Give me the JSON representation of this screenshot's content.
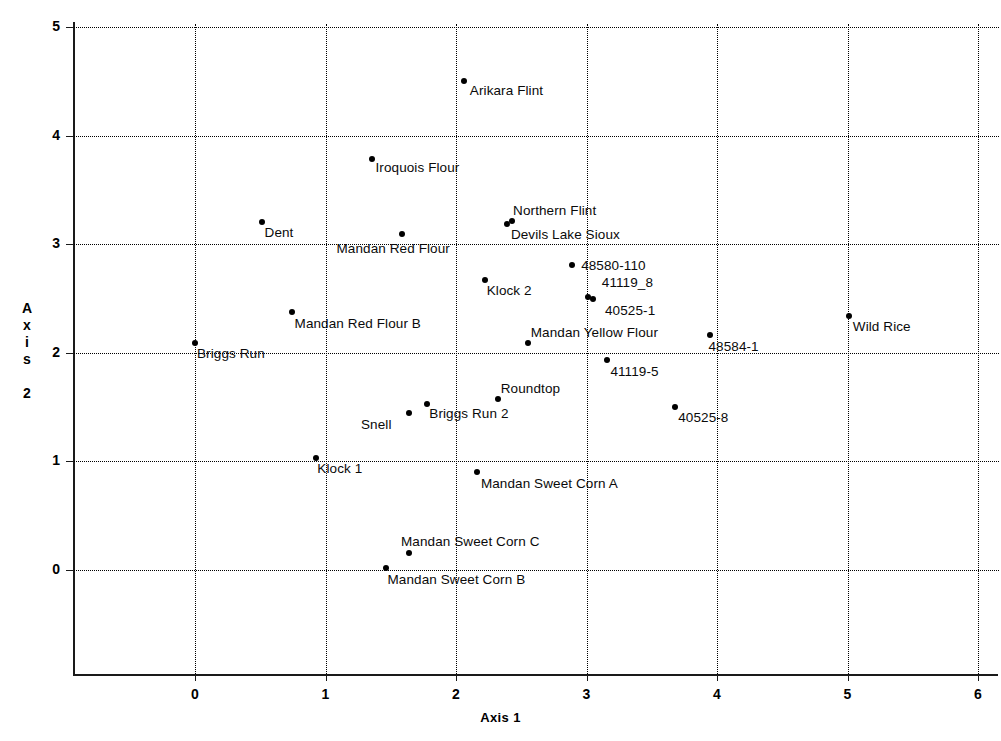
{
  "chart_data": {
    "type": "scatter",
    "title": "",
    "xlabel": "Axis 1",
    "ylabel": "Axis 2",
    "xlim": [
      -0.85,
      6.17
    ],
    "ylim": [
      -0.85,
      5.03
    ],
    "xticks": [
      0,
      1,
      2,
      3,
      4,
      5,
      6
    ],
    "xticklabels": [
      "0",
      "1",
      "2",
      "3",
      "4",
      "5",
      "6"
    ],
    "yticks": [
      0,
      1,
      2,
      3,
      4,
      5
    ],
    "yticklabels": [
      "0",
      "1",
      "2",
      "3",
      "4",
      "5"
    ],
    "grid": true,
    "grid_style": "dotted",
    "legend": "none",
    "marker_color": "#000000",
    "points": [
      {
        "label": "Arikara Flint",
        "x": 2.06,
        "y": 4.5,
        "lx": 6,
        "ly": 2
      },
      {
        "label": "Iroquois Flour",
        "x": 1.36,
        "y": 3.78,
        "lx": 3,
        "ly": 1
      },
      {
        "label": "Dent",
        "x": 0.51,
        "y": 3.2,
        "lx": 3,
        "ly": 3
      },
      {
        "label": "Northern Flint",
        "x": 2.43,
        "y": 3.21,
        "lx": 1,
        "ly": -18
      },
      {
        "label": "Devils Lake Sioux",
        "x": 2.39,
        "y": 3.19,
        "lx": 4,
        "ly": 3
      },
      {
        "label": "Mandan Red Flour",
        "x": 1.59,
        "y": 3.09,
        "lx": -66,
        "ly": 7
      },
      {
        "label": "48580-110",
        "x": 2.89,
        "y": 2.81,
        "lx": 9,
        "ly": -7
      },
      {
        "label": "Klock 2",
        "x": 2.22,
        "y": 2.67,
        "lx": 2,
        "ly": 3
      },
      {
        "label": "41119_8",
        "x": 3.01,
        "y": 2.51,
        "lx": 14,
        "ly": -22
      },
      {
        "label": "40525-1",
        "x": 3.05,
        "y": 2.5,
        "lx": 12,
        "ly": 4
      },
      {
        "label": "Mandan Red Flour B",
        "x": 0.74,
        "y": 2.38,
        "lx": 3,
        "ly": 4
      },
      {
        "label": "Wild Rice",
        "x": 5.01,
        "y": 2.34,
        "lx": 4,
        "ly": 3
      },
      {
        "label": "48584-1",
        "x": 3.95,
        "y": 2.16,
        "lx": -2,
        "ly": 4
      },
      {
        "label": "Briggs Run",
        "x": 0.0,
        "y": 2.09,
        "lx": 2,
        "ly": 3
      },
      {
        "label": "Mandan Yellow Flour",
        "x": 2.55,
        "y": 2.09,
        "lx": 3,
        "ly": -18
      },
      {
        "label": "41119-5",
        "x": 3.16,
        "y": 1.93,
        "lx": 3,
        "ly": 4
      },
      {
        "label": "Roundtop",
        "x": 2.32,
        "y": 1.57,
        "lx": 3,
        "ly": -18
      },
      {
        "label": "Briggs Run 2",
        "x": 1.78,
        "y": 1.53,
        "lx": 2,
        "ly": 2
      },
      {
        "label": "Snell",
        "x": 1.64,
        "y": 1.45,
        "lx": -48,
        "ly": 4
      },
      {
        "label": "40525-8",
        "x": 3.68,
        "y": 1.5,
        "lx": 3,
        "ly": 3
      },
      {
        "label": "Klock 1",
        "x": 0.93,
        "y": 1.03,
        "lx": 1,
        "ly": 3
      },
      {
        "label": "Mandan Sweet Corn A",
        "x": 2.16,
        "y": 0.9,
        "lx": 4,
        "ly": 4
      },
      {
        "label": "Mandan Sweet Corn C",
        "x": 1.64,
        "y": 0.16,
        "lx": -8,
        "ly": -19
      },
      {
        "label": "Mandan Sweet Corn B",
        "x": 1.46,
        "y": 0.02,
        "lx": 2,
        "ly": 4
      }
    ]
  }
}
